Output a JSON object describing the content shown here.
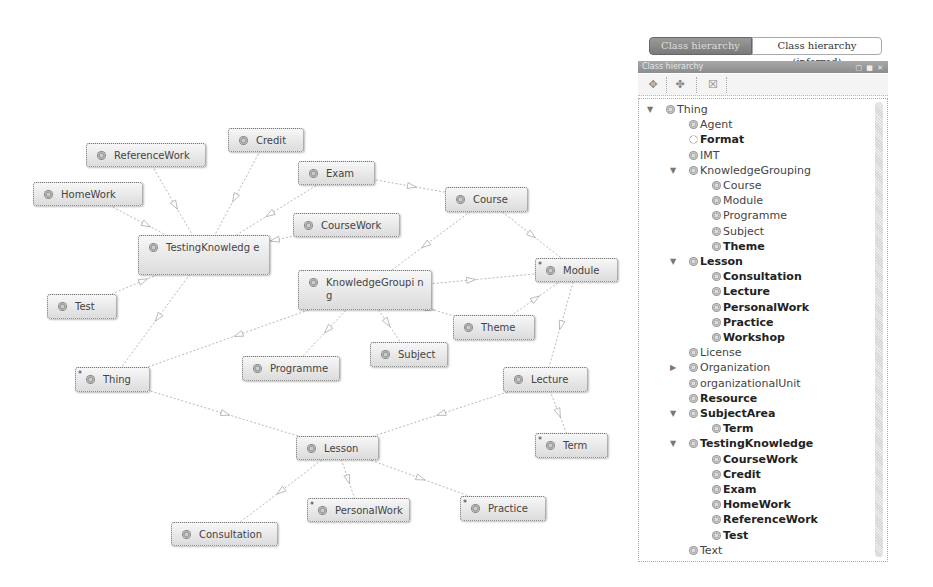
{
  "graph": {
    "nodes": [
      {
        "id": "ReferenceWork",
        "label": "ReferenceWork",
        "x": 86,
        "y": 143,
        "w": 120,
        "h": 24,
        "star": false
      },
      {
        "id": "Credit",
        "label": "Credit",
        "x": 228,
        "y": 128,
        "w": 76,
        "h": 24,
        "star": false
      },
      {
        "id": "Exam",
        "label": "Exam",
        "x": 298,
        "y": 161,
        "w": 77,
        "h": 24,
        "star": false
      },
      {
        "id": "HomeWork",
        "label": "HomeWork",
        "x": 33,
        "y": 182,
        "w": 110,
        "h": 24,
        "star": false
      },
      {
        "id": "CourseWork",
        "label": "CourseWork",
        "x": 293,
        "y": 213,
        "w": 107,
        "h": 24,
        "star": false
      },
      {
        "id": "Course",
        "label": "Course",
        "x": 445,
        "y": 187,
        "w": 83,
        "h": 25,
        "star": false
      },
      {
        "id": "TestingKnowledge",
        "label": "TestingKnowledg e",
        "x": 138,
        "y": 235,
        "w": 132,
        "h": 40,
        "star": false
      },
      {
        "id": "Module",
        "label": "Module",
        "x": 535,
        "y": 258,
        "w": 83,
        "h": 24,
        "star": true
      },
      {
        "id": "KnowledgeGrouping",
        "label": "KnowledgeGroupi ng",
        "x": 298,
        "y": 270,
        "w": 134,
        "h": 40,
        "star": false
      },
      {
        "id": "Test",
        "label": "Test",
        "x": 47,
        "y": 294,
        "w": 70,
        "h": 25,
        "star": false
      },
      {
        "id": "Theme",
        "label": "Theme",
        "x": 453,
        "y": 315,
        "w": 82,
        "h": 25,
        "star": false
      },
      {
        "id": "Subject",
        "label": "Subject",
        "x": 370,
        "y": 342,
        "w": 78,
        "h": 25,
        "star": false
      },
      {
        "id": "Programme",
        "label": "Programme",
        "x": 242,
        "y": 356,
        "w": 98,
        "h": 25,
        "star": false
      },
      {
        "id": "Thing",
        "label": "Thing",
        "x": 75,
        "y": 367,
        "w": 75,
        "h": 25,
        "star": true
      },
      {
        "id": "Lecture",
        "label": "Lecture",
        "x": 503,
        "y": 367,
        "w": 85,
        "h": 25,
        "star": false
      },
      {
        "id": "Term",
        "label": "Term",
        "x": 535,
        "y": 433,
        "w": 73,
        "h": 25,
        "star": true
      },
      {
        "id": "Lesson",
        "label": "Lesson",
        "x": 296,
        "y": 436,
        "w": 83,
        "h": 24,
        "star": false
      },
      {
        "id": "Practice",
        "label": "Practice",
        "x": 460,
        "y": 496,
        "w": 86,
        "h": 25,
        "star": true
      },
      {
        "id": "PersonalWork",
        "label": "PersonalWork",
        "x": 307,
        "y": 498,
        "w": 103,
        "h": 24,
        "star": true
      },
      {
        "id": "Consultation",
        "label": "Consultation",
        "x": 171,
        "y": 522,
        "w": 107,
        "h": 24,
        "star": false
      }
    ],
    "edges": [
      [
        "ReferenceWork",
        "TestingKnowledge"
      ],
      [
        "Credit",
        "TestingKnowledge"
      ],
      [
        "Exam",
        "TestingKnowledge"
      ],
      [
        "HomeWork",
        "TestingKnowledge"
      ],
      [
        "CourseWork",
        "TestingKnowledge"
      ],
      [
        "Test",
        "TestingKnowledge"
      ],
      [
        "TestingKnowledge",
        "Thing"
      ],
      [
        "Exam",
        "Course"
      ],
      [
        "Course",
        "KnowledgeGrouping"
      ],
      [
        "Course",
        "Module"
      ],
      [
        "KnowledgeGrouping",
        "Module"
      ],
      [
        "Theme",
        "Module"
      ],
      [
        "KnowledgeGrouping",
        "Theme"
      ],
      [
        "KnowledgeGrouping",
        "Subject"
      ],
      [
        "KnowledgeGrouping",
        "Programme"
      ],
      [
        "KnowledgeGrouping",
        "Thing"
      ],
      [
        "Module",
        "Lecture"
      ],
      [
        "Thing",
        "Lesson"
      ],
      [
        "Lecture",
        "Lesson"
      ],
      [
        "Lecture",
        "Term"
      ],
      [
        "Lesson",
        "Consultation"
      ],
      [
        "Lesson",
        "PersonalWork"
      ],
      [
        "Lesson",
        "Practice"
      ]
    ],
    "edge_color": "#b8b8b8"
  },
  "panel": {
    "tabs": [
      {
        "label": "Class hierarchy",
        "active": true
      },
      {
        "label": "Class hierarchy (inferred)",
        "active": false
      }
    ],
    "view_title": "Class hierarchy",
    "view_buttons": "□ ■ ✕",
    "toolbar": [
      {
        "name": "add-subclass",
        "glyph": "✥"
      },
      {
        "name": "add-sibling",
        "glyph": "✤"
      },
      {
        "name": "delete-class",
        "glyph": "☒"
      }
    ],
    "tree": [
      {
        "label": "Thing",
        "depth": 0,
        "toggle": "▼",
        "bold": false,
        "hollow": false
      },
      {
        "label": "Agent",
        "depth": 1,
        "toggle": "",
        "bold": false,
        "hollow": false
      },
      {
        "label": "Format",
        "depth": 1,
        "toggle": "",
        "bold": true,
        "hollow": true
      },
      {
        "label": "IMT",
        "depth": 1,
        "toggle": "",
        "bold": false,
        "hollow": false
      },
      {
        "label": "KnowledgeGrouping",
        "depth": 1,
        "toggle": "▼",
        "bold": false,
        "hollow": false
      },
      {
        "label": "Course",
        "depth": 2,
        "toggle": "",
        "bold": false,
        "hollow": false
      },
      {
        "label": "Module",
        "depth": 2,
        "toggle": "",
        "bold": false,
        "hollow": false
      },
      {
        "label": "Programme",
        "depth": 2,
        "toggle": "",
        "bold": false,
        "hollow": false
      },
      {
        "label": "Subject",
        "depth": 2,
        "toggle": "",
        "bold": false,
        "hollow": false
      },
      {
        "label": "Theme",
        "depth": 2,
        "toggle": "",
        "bold": true,
        "hollow": false
      },
      {
        "label": "Lesson",
        "depth": 1,
        "toggle": "▼",
        "bold": true,
        "hollow": false
      },
      {
        "label": "Consultation",
        "depth": 2,
        "toggle": "",
        "bold": true,
        "hollow": false
      },
      {
        "label": "Lecture",
        "depth": 2,
        "toggle": "",
        "bold": true,
        "hollow": false
      },
      {
        "label": "PersonalWork",
        "depth": 2,
        "toggle": "",
        "bold": true,
        "hollow": false
      },
      {
        "label": "Practice",
        "depth": 2,
        "toggle": "",
        "bold": true,
        "hollow": false
      },
      {
        "label": "Workshop",
        "depth": 2,
        "toggle": "",
        "bold": true,
        "hollow": false
      },
      {
        "label": "License",
        "depth": 1,
        "toggle": "",
        "bold": false,
        "hollow": false
      },
      {
        "label": "Organization",
        "depth": 1,
        "toggle": "▶",
        "bold": false,
        "hollow": false
      },
      {
        "label": "organizationalUnit",
        "depth": 1,
        "toggle": "",
        "bold": false,
        "hollow": false
      },
      {
        "label": "Resource",
        "depth": 1,
        "toggle": "",
        "bold": true,
        "hollow": false
      },
      {
        "label": "SubjectArea",
        "depth": 1,
        "toggle": "▼",
        "bold": true,
        "hollow": false
      },
      {
        "label": "Term",
        "depth": 2,
        "toggle": "",
        "bold": true,
        "hollow": false
      },
      {
        "label": "TestingKnowledge",
        "depth": 1,
        "toggle": "▼",
        "bold": true,
        "hollow": false
      },
      {
        "label": "CourseWork",
        "depth": 2,
        "toggle": "",
        "bold": true,
        "hollow": false
      },
      {
        "label": "Credit",
        "depth": 2,
        "toggle": "",
        "bold": true,
        "hollow": false
      },
      {
        "label": "Exam",
        "depth": 2,
        "toggle": "",
        "bold": true,
        "hollow": false
      },
      {
        "label": "HomeWork",
        "depth": 2,
        "toggle": "",
        "bold": true,
        "hollow": false
      },
      {
        "label": "ReferenceWork",
        "depth": 2,
        "toggle": "",
        "bold": true,
        "hollow": false
      },
      {
        "label": "Test",
        "depth": 2,
        "toggle": "",
        "bold": true,
        "hollow": false
      },
      {
        "label": "Text",
        "depth": 1,
        "toggle": "",
        "bold": false,
        "hollow": false
      }
    ]
  }
}
